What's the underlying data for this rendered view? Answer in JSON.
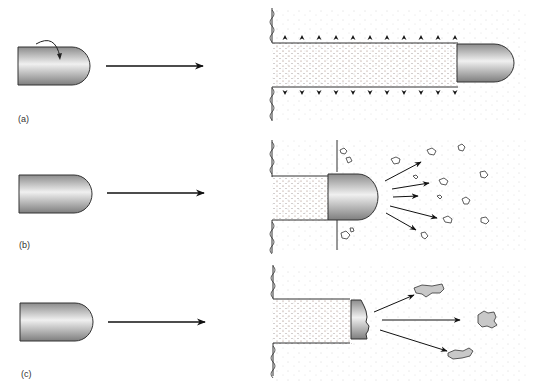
{
  "panels": [
    {
      "id": "a",
      "label": "(a)",
      "description": "Spinning bullet penetrates target, creating a cavity with outward pressure"
    },
    {
      "id": "b",
      "label": "(b)",
      "description": "Bullet fragments target material, debris projected forward"
    },
    {
      "id": "c",
      "label": "(c)",
      "description": "Bullet deforms and fragments, large irregular fragments projected"
    }
  ],
  "colors": {
    "bullet_dark": "#8a8a8a",
    "bullet_light": "#f2f2f2",
    "stroke": "#222222",
    "stipple": "#9a7a6a"
  }
}
